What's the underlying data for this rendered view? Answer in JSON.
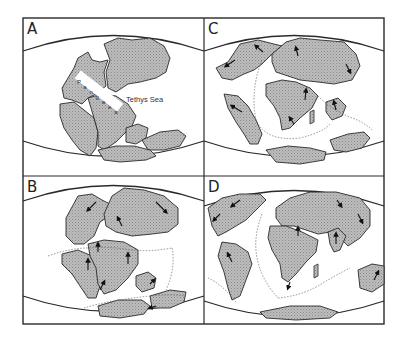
{
  "figure": {
    "panels": [
      {
        "id": "A",
        "label": "A",
        "annotations": {
          "supercontinent": "Pangaea",
          "supercontinent_letters": [
            "P",
            "a",
            "n",
            "g",
            "a",
            "e",
            "a"
          ],
          "sea": "Tethys Sea"
        }
      },
      {
        "id": "B",
        "label": "B"
      },
      {
        "id": "C",
        "label": "C"
      },
      {
        "id": "D",
        "label": "D"
      }
    ]
  },
  "colors": {
    "land_fill": "#b3b3b3",
    "land_stroke": "#2a2a2a",
    "frame": "#2a2a2a",
    "background": "#ffffff",
    "rift": "#555555"
  }
}
